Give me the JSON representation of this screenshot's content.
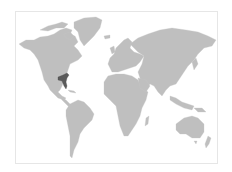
{
  "map": {
    "type": "world-locator-map",
    "projection": "miller-like",
    "colors": {
      "background": "#ffffff",
      "frame": "#e6e6e6",
      "land": "#bfbfbf",
      "highlight": "#5a5a5a"
    },
    "highlighted_region": "Southeastern United States",
    "continents": [
      "North America",
      "Greenland",
      "South America",
      "Europe",
      "Africa",
      "Asia",
      "Australia"
    ]
  }
}
